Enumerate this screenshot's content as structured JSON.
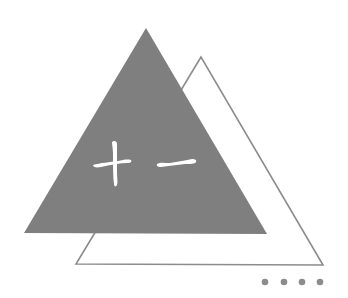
{
  "graphic": {
    "chapter_number_text": "十一",
    "chapter_number_meaning": "eleven"
  },
  "colors": {
    "background": "#ffffff",
    "filled_triangle": "#7f7f7f",
    "outline_triangle_stroke": "#8c8c8c",
    "dots": "#8c8c8c",
    "text": "#ffffff"
  },
  "shapes": {
    "filled_triangle": {
      "points": "146,28 24,233 267,234"
    },
    "outline_triangle": {
      "points": "201,57 76,264 323,265"
    },
    "dots": [
      {
        "cx": 265,
        "cy": 282,
        "r": 3.3
      },
      {
        "cx": 284,
        "cy": 282,
        "r": 3.3
      },
      {
        "cx": 302,
        "cy": 282,
        "r": 3.3
      },
      {
        "cx": 320,
        "cy": 282,
        "r": 3.3
      }
    ]
  }
}
